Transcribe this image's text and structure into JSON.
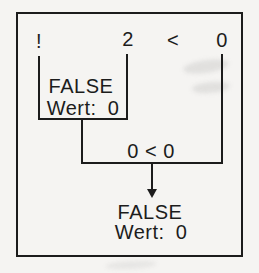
{
  "colors": {
    "ink": "#1c1c1c",
    "paper": "#f5f4f2"
  },
  "diagram": {
    "expression": {
      "tokens": [
        {
          "label": "!"
        },
        {
          "label": "2"
        },
        {
          "label": "<"
        },
        {
          "label": "0"
        }
      ]
    },
    "step1": {
      "result": "FALSE",
      "value": "Wert: 0"
    },
    "step2": {
      "label": "0 < 0"
    },
    "final": {
      "result": "FALSE",
      "value": "Wert: 0"
    }
  }
}
